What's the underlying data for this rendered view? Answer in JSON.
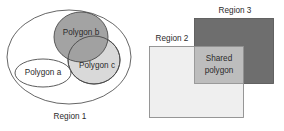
{
  "figure": {
    "background": "#ffffff"
  },
  "left_diagram": {
    "name": "containment-diagram",
    "outer_label": "Region 1",
    "shapes": [
      {
        "id": "region1",
        "label": "Region 1",
        "kind": "ellipse",
        "fill": "#ffffff",
        "stroke": "#555555"
      },
      {
        "id": "polygon_b",
        "label": "Polygon b",
        "kind": "ellipse",
        "fill": "#9e9e9e",
        "stroke": "#4a4a4a"
      },
      {
        "id": "polygon_c",
        "label": "Polygon c",
        "kind": "ellipse",
        "fill": "#d8d8d8",
        "stroke": "#4a4a4a"
      },
      {
        "id": "polygon_a",
        "label": "Polygon a",
        "kind": "ellipse",
        "fill": "#ffffff",
        "stroke": "#4a4a4a"
      }
    ]
  },
  "right_diagram": {
    "name": "overlap-diagram",
    "shapes": [
      {
        "id": "region3",
        "label": "Region 3",
        "kind": "rect",
        "fill": "#6e6e6e",
        "stroke": "#5a5a5a"
      },
      {
        "id": "region2",
        "label": "Region 2",
        "kind": "rect",
        "fill": "#eeeeee",
        "stroke": "#8c8c8c"
      },
      {
        "id": "shared",
        "label": "Shared\npolygon",
        "label_line1": "Shared",
        "label_line2": "polygon",
        "kind": "rect",
        "fill": "#bdbdbd",
        "stroke": "#8c8c8c"
      }
    ]
  },
  "colors": {
    "dark_gray": "#6e6e6e",
    "mid_gray": "#9e9e9e",
    "light_gray": "#eeeeee",
    "shared_gray": "#bdbdbd",
    "outline": "#555555",
    "text": "#2b2b2b"
  }
}
